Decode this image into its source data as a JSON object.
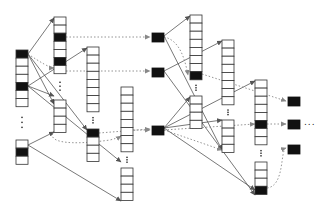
{
  "diagram": {
    "title": "",
    "colors": {
      "stroke": "#333333",
      "filled": "#111111",
      "solid_edge": "#555555",
      "dotted_edge": "#888888",
      "background": "#ffffff"
    },
    "columns": [
      {
        "id": "A",
        "segments": [
          {
            "cells": 7,
            "filled": [
              0,
              4
            ]
          },
          {
            "cells": 3,
            "filled": [
              1
            ]
          }
        ]
      },
      {
        "id": "B",
        "segments": [
          {
            "cells": 7,
            "filled": [
              2,
              5
            ]
          },
          {
            "cells": 4,
            "filled": []
          }
        ]
      },
      {
        "id": "C",
        "segments": [
          {
            "cells": 8,
            "filled": []
          },
          {
            "cells": 4,
            "filled": [
              0
            ]
          }
        ]
      },
      {
        "id": "D",
        "segments": [
          {
            "cells": 8,
            "filled": []
          },
          {
            "cells": 4,
            "filled": []
          }
        ]
      },
      {
        "id": "F",
        "segments": [
          {
            "cells": 8,
            "filled": [
              7
            ]
          },
          {
            "cells": 4,
            "filled": []
          }
        ]
      },
      {
        "id": "G",
        "segments": [
          {
            "cells": 8,
            "filled": []
          },
          {
            "cells": 4,
            "filled": []
          }
        ]
      },
      {
        "id": "H",
        "segments": [
          {
            "cells": 8,
            "filled": [
              5
            ]
          },
          {
            "cells": 4,
            "filled": [
              3
            ]
          }
        ]
      }
    ],
    "level2_nodes": 3,
    "level3_nodes": 3,
    "continuation": "..."
  }
}
